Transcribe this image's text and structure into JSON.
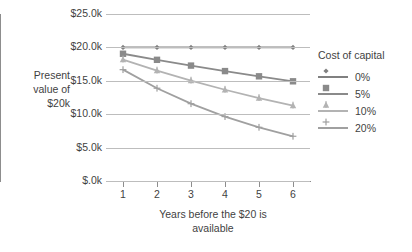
{
  "chart_data": {
    "type": "line",
    "title": "",
    "xlabel": "Years before the $20 is available",
    "ylabel": "Present value of $20k",
    "legend_title": "Cost of capital",
    "legend_position": "right",
    "grid": true,
    "x": [
      1,
      2,
      3,
      4,
      5,
      6
    ],
    "xtick_labels": [
      "1",
      "2",
      "3",
      "4",
      "5",
      "6"
    ],
    "xlim": [
      0.5,
      6.5
    ],
    "ylim": [
      0,
      25000
    ],
    "ytick_values": [
      25000,
      20000,
      15000,
      10000,
      5000,
      0
    ],
    "ytick_labels": [
      "$25.0k",
      "$20.0k",
      "$15.0k",
      "$10.0k",
      "$5.0k",
      "$.0k"
    ],
    "series": [
      {
        "name": "0%",
        "marker": "diamond",
        "color": "#808080",
        "values": [
          20000,
          20000,
          20000,
          20000,
          20000,
          20000
        ]
      },
      {
        "name": "5%",
        "marker": "square",
        "color": "#8a8a8a",
        "values": [
          19048,
          18141,
          17277,
          16454,
          15671,
          14924
        ]
      },
      {
        "name": "10%",
        "marker": "star",
        "color": "#b3b3b3",
        "values": [
          18182,
          16529,
          15026,
          13660,
          12418,
          11289
        ]
      },
      {
        "name": "20%",
        "marker": "cross",
        "color": "#a0a0a0",
        "values": [
          16667,
          13889,
          11574,
          9645,
          8038,
          6698
        ]
      }
    ]
  },
  "axis": {
    "ylabel_lines": [
      "Present",
      "value of",
      "$20k"
    ],
    "xlabel_lines": [
      "Years before the $20 is",
      "available"
    ]
  }
}
